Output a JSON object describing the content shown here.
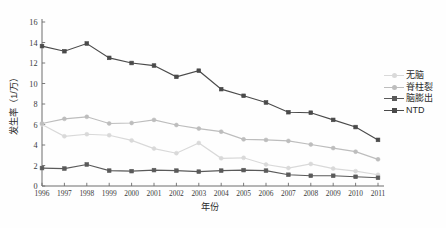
{
  "chart_data": {
    "type": "line",
    "title": "",
    "xlabel": "年份",
    "ylabel": "发生率（1/万）",
    "xlim": [
      1996,
      2011
    ],
    "ylim": [
      0,
      16
    ],
    "ytick_step": 2,
    "grid": false,
    "legend_position": "right",
    "x": [
      1996,
      1997,
      1998,
      1999,
      2000,
      2001,
      2002,
      2003,
      2004,
      2005,
      2006,
      2007,
      2008,
      2009,
      2010,
      2011
    ],
    "categories": [
      "1996",
      "1997",
      "1998",
      "1999",
      "2000",
      "2001",
      "2002",
      "2003",
      "2004",
      "2005",
      "2006",
      "2007",
      "2008",
      "2009",
      "2010",
      "2011"
    ],
    "yticks": [
      "0",
      "2",
      "4",
      "6",
      "8",
      "10",
      "12",
      "14",
      "16"
    ],
    "series": [
      {
        "name": "无脑",
        "color": "#d9d9d9",
        "marker": "circle",
        "values": [
          6.0,
          4.85,
          5.05,
          4.95,
          4.45,
          3.65,
          3.2,
          4.2,
          2.7,
          2.75,
          2.1,
          1.75,
          2.15,
          1.7,
          1.45,
          1.1
        ]
      },
      {
        "name": "脊柱裂",
        "color": "#bdbdbd",
        "marker": "circle",
        "values": [
          6.1,
          6.55,
          6.75,
          6.1,
          6.15,
          6.45,
          5.95,
          5.6,
          5.3,
          4.55,
          4.5,
          4.4,
          4.05,
          3.7,
          3.35,
          2.6
        ]
      },
      {
        "name": "脑膨出",
        "color": "#5a5a5a",
        "marker": "square",
        "values": [
          1.75,
          1.7,
          2.1,
          1.5,
          1.45,
          1.55,
          1.5,
          1.4,
          1.5,
          1.55,
          1.5,
          1.1,
          1.0,
          1.0,
          0.9,
          0.8
        ]
      },
      {
        "name": "NTD",
        "color": "#4a4a4a",
        "marker": "square",
        "values": [
          13.65,
          13.15,
          13.9,
          12.5,
          12.0,
          11.75,
          10.65,
          11.25,
          9.45,
          8.8,
          8.15,
          7.2,
          7.15,
          6.45,
          5.75,
          4.5
        ]
      }
    ]
  }
}
